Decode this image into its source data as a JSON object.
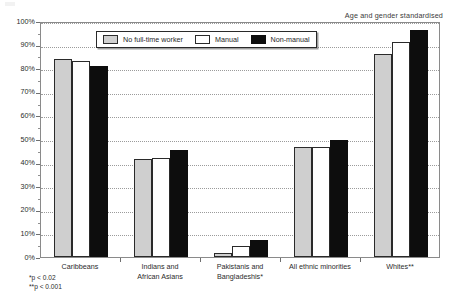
{
  "annotation": "Age and gender standardised",
  "legend": {
    "items": [
      {
        "label": "No full-time worker",
        "swatch": "light-grey"
      },
      {
        "label": "Manual",
        "swatch": "white"
      },
      {
        "label": "Non-manual",
        "swatch": "black"
      }
    ]
  },
  "footnotes": [
    "*p < 0.02",
    "**p < 0.001"
  ],
  "y_axis": {
    "ticks": [
      "0%",
      "10%",
      "20%",
      "30%",
      "40%",
      "50%",
      "60%",
      "70%",
      "80%",
      "90%",
      "100%"
    ]
  },
  "chart_data": {
    "type": "bar",
    "title": "",
    "subtitle": "",
    "xlabel": "",
    "ylabel": "",
    "ylim": [
      0,
      100
    ],
    "ytick_interval": 10,
    "grid": true,
    "grid_style": "dotted-horizontal",
    "legend_position": "top-center-inside",
    "annotation": "Age and gender standardised",
    "categories": [
      "Caribbeans",
      "Indians and African Asians",
      "Pakistanis and Bangladeshis*",
      "All ethnic minorities",
      "Whites**"
    ],
    "category_lines": [
      [
        "Caribbeans"
      ],
      [
        "Indians and",
        "African Asians"
      ],
      [
        "Pakistanis and",
        "Bangladeshis*"
      ],
      [
        "All ethnic minorities"
      ],
      [
        "Whites**"
      ]
    ],
    "series": [
      {
        "name": "No full-time worker",
        "color": "#cfcfcf",
        "values": [
          84,
          41.5,
          1.5,
          46.5,
          86
        ]
      },
      {
        "name": "Manual",
        "color": "#ffffff",
        "values": [
          83,
          42,
          4.5,
          46.5,
          91
        ]
      },
      {
        "name": "Non-manual",
        "color": "#0d0d0d",
        "values": [
          81,
          45.5,
          7,
          49.5,
          96
        ]
      }
    ],
    "units": "percent",
    "footnotes": [
      "*p < 0.02",
      "**p < 0.001"
    ]
  }
}
